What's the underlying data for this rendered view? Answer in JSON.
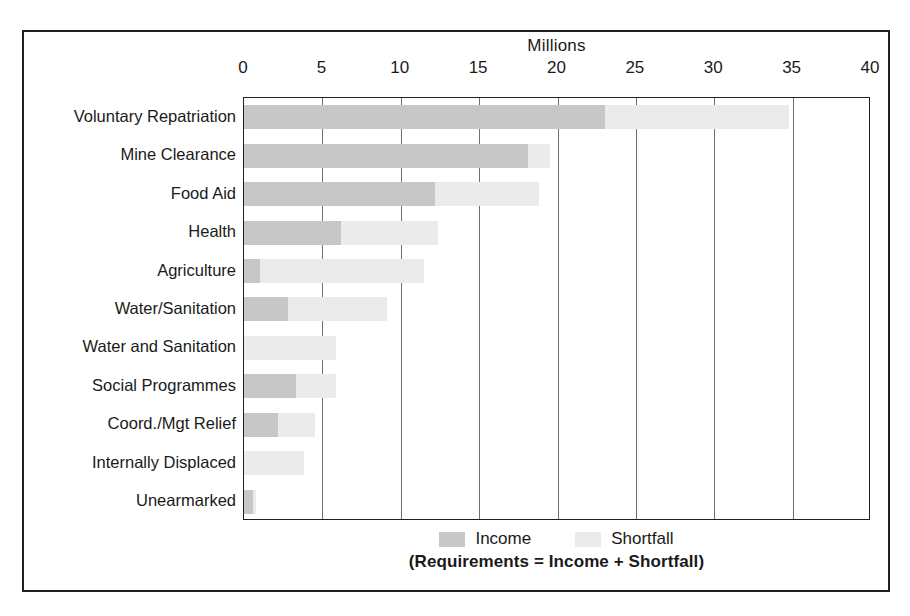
{
  "chart_data": {
    "type": "bar",
    "orientation": "horizontal",
    "stacked": true,
    "title": "Millions",
    "xlabel": "Millions",
    "ylabel": "",
    "xlim": [
      0,
      40
    ],
    "xticks": [
      0,
      5,
      10,
      15,
      20,
      25,
      30,
      35,
      40
    ],
    "xtick_labels": [
      "0",
      "5",
      "10",
      "15",
      "20",
      "25",
      "30",
      "35",
      "40"
    ],
    "grid": true,
    "grid_axis": "x",
    "legend_position": "bottom",
    "footnote": "(Requirements = Income + Shortfall)",
    "categories": [
      "Voluntary Repatriation",
      "Mine Clearance",
      "Food Aid",
      "Health",
      "Agriculture",
      "Water/Sanitation",
      "Water and Sanitation",
      "Social Programmes",
      "Coord./Mgt Relief",
      "Internally Displaced",
      "Unearmarked"
    ],
    "series": [
      {
        "name": "Income",
        "color": "#c7c7c7",
        "values": [
          23.0,
          18.1,
          12.2,
          6.2,
          1.0,
          2.8,
          0.0,
          3.3,
          2.2,
          0.0,
          0.55
        ]
      },
      {
        "name": "Shortfall",
        "color": "#ebebeb",
        "values": [
          11.8,
          1.4,
          6.6,
          6.2,
          10.5,
          6.3,
          5.9,
          2.6,
          2.3,
          3.8,
          0.2
        ]
      }
    ],
    "totals": [
      34.8,
      19.5,
      18.8,
      12.4,
      11.5,
      9.1,
      5.9,
      5.9,
      4.5,
      3.8,
      0.75
    ]
  },
  "legend": {
    "items": [
      {
        "label": "Income",
        "color": "#c7c7c7"
      },
      {
        "label": "Shortfall",
        "color": "#ebebeb"
      }
    ]
  },
  "colors": {
    "income": "#c7c7c7",
    "shortfall": "#ebebeb",
    "frame": "#231f20",
    "gridline": "#6f6f6f",
    "background": "#ffffff"
  }
}
